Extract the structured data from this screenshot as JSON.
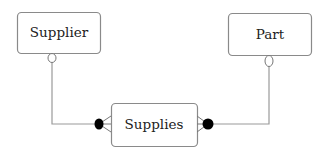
{
  "diagram": {
    "type": "entity-relationship",
    "entities": [
      {
        "id": "supplier",
        "label": "Supplier"
      },
      {
        "id": "part",
        "label": "Part"
      },
      {
        "id": "supplies",
        "label": "Supplies"
      }
    ],
    "relationships": [
      {
        "from": "supplier",
        "to": "supplies",
        "from_end": "optional (circle)",
        "to_end": "many (crow's foot with dot)"
      },
      {
        "from": "part",
        "to": "supplies",
        "from_end": "optional (circle)",
        "to_end": "many (crow's foot with dot)"
      }
    ],
    "colors": {
      "box_stroke": "#8a8a8a",
      "line": "#9a9a9a",
      "dot": "#000000"
    }
  }
}
